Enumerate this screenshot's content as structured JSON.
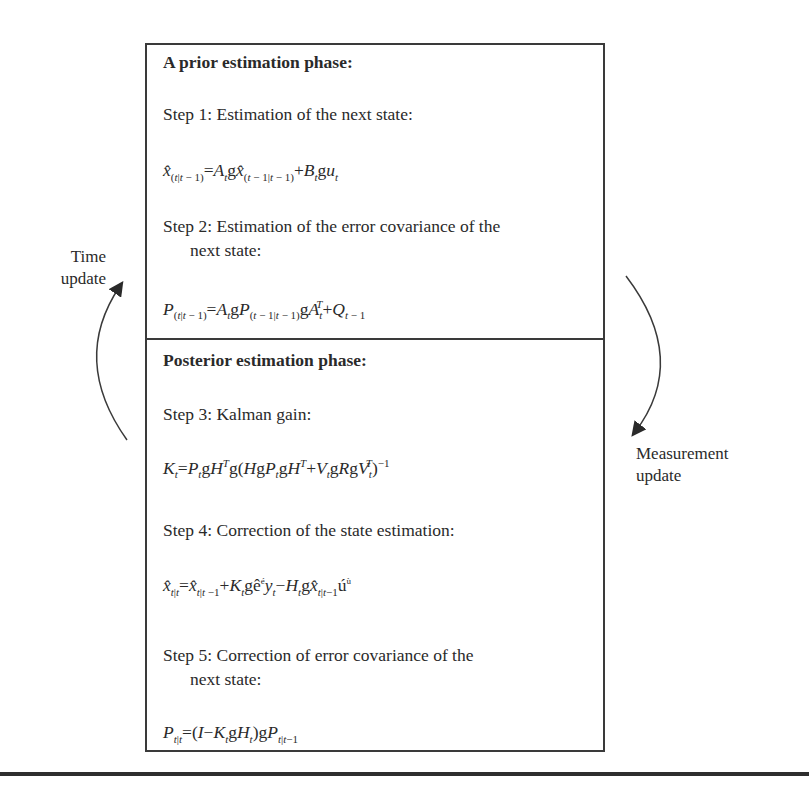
{
  "diagram": {
    "prior_phase": {
      "heading": "A prior estimation phase:",
      "step1": {
        "label": "Step 1: Estimation of the next state:",
        "equation": "x̂(t|t−1) = A_t g x̂(t−1|t−1) + B_t g u_t"
      },
      "step2": {
        "label_line1": "Step 2: Estimation of the error covariance of the",
        "label_line2": "next state:",
        "equation": "P(t|t−1) = A_t g P(t−1|t−1) g A_t^T + Q_{t−1}"
      }
    },
    "posterior_phase": {
      "heading": "Posterior estimation phase:",
      "step3": {
        "label": "Step 3: Kalman gain:",
        "equation": "K_t = P_t g H^T g (H g P_t g H^T + V_t g R g V_t^T)^−1"
      },
      "step4": {
        "label": "Step 4: Correction of the state estimation:",
        "equation": "x̂_{t|t} = x̂_{t|t−1} + K_t g ê[y_t − H_t g x̂_{t|t−1}]û"
      },
      "step5": {
        "label_line1": "Step 5: Correction of error covariance of the",
        "label_line2": "next state:",
        "equation": "P_{t|t} = (I − K_t g H_t) g P_{t|t−1}"
      }
    },
    "arrows": {
      "left": {
        "label_line1": "Time",
        "label_line2": "update",
        "direction": "up"
      },
      "right": {
        "label_line1": "Measurement",
        "label_line2": "update",
        "direction": "down"
      }
    },
    "colors": {
      "stroke": "#3a3a3a",
      "text": "#2a2a2a",
      "rule": "#2e2e2e"
    }
  }
}
